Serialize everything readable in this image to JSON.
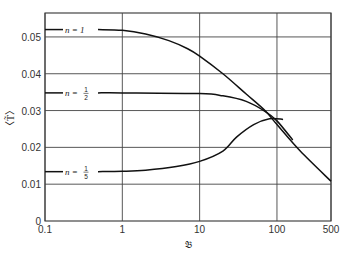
{
  "chart_data": {
    "type": "line",
    "title": "",
    "xlabel": "𝔅",
    "ylabel": "<T̃>",
    "xscale": "log",
    "xlim": [
      0.1,
      500
    ],
    "ylim": [
      0,
      0.0565
    ],
    "grid": true,
    "x_ticks": [
      0.1,
      1,
      10,
      100,
      500
    ],
    "x_tick_labels": [
      "0.1",
      "1",
      "10",
      "100",
      "500"
    ],
    "y_ticks": [
      0,
      0.01,
      0.02,
      0.03,
      0.04,
      0.05
    ],
    "y_tick_labels": [
      "0",
      "0.01",
      "0.02",
      "0.03",
      "0.04",
      "0.05"
    ],
    "series": [
      {
        "name": "n = 1",
        "label_main": "n = 1",
        "x": [
          0.1,
          0.3,
          1,
          2,
          4,
          7,
          10,
          20,
          40,
          70,
          100,
          200,
          500
        ],
        "y": [
          0.052,
          0.052,
          0.0518,
          0.0508,
          0.049,
          0.0468,
          0.0448,
          0.04,
          0.0345,
          0.03,
          0.0262,
          0.019,
          0.0108
        ]
      },
      {
        "name": "n = 1/2",
        "label_main": "n = ",
        "label_num": "1",
        "label_den": "2",
        "x": [
          0.1,
          1,
          10,
          20,
          40,
          70,
          100,
          160
        ],
        "y": [
          0.0348,
          0.0348,
          0.0346,
          0.034,
          0.0325,
          0.0298,
          0.0272,
          0.022
        ]
      },
      {
        "name": "n = 1/5",
        "label_main": "n = ",
        "label_num": "1",
        "label_den": "5",
        "x": [
          0.1,
          1,
          2,
          5,
          10,
          20,
          30,
          50,
          80,
          120
        ],
        "y": [
          0.0134,
          0.0135,
          0.0138,
          0.0148,
          0.0162,
          0.019,
          0.0228,
          0.0262,
          0.0278,
          0.0276
        ]
      }
    ]
  }
}
